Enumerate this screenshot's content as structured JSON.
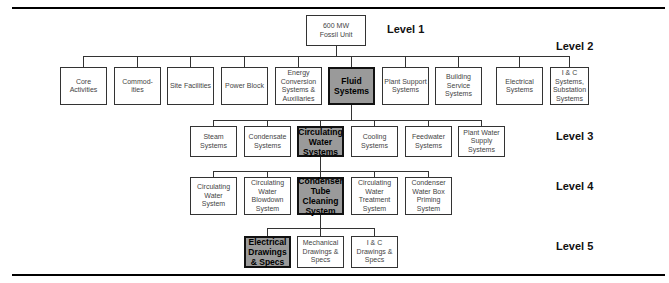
{
  "level_labels": [
    "Level 1",
    "Level 2",
    "Level 3",
    "Level 4",
    "Level 5"
  ],
  "level1": {
    "label": "600 MW\nFossil Unit"
  },
  "level2": [
    {
      "label": "Core Activities"
    },
    {
      "label": "Commod-ities"
    },
    {
      "label": "Site Facilities"
    },
    {
      "label": "Power Block"
    },
    {
      "label": "Energy Conversion Systems & Auxiliaries"
    },
    {
      "label": "Fluid Systems",
      "highlighted": true
    },
    {
      "label": "Plant Support Systems"
    },
    {
      "label": "Building Service Systems"
    },
    {
      "label": "Electrical Systems"
    },
    {
      "label": "I & C Systems, Substation Systems"
    }
  ],
  "level3": [
    {
      "label": "Steam Systems"
    },
    {
      "label": "Condensate Systems"
    },
    {
      "label": "Circulating Water Systems",
      "highlighted": true
    },
    {
      "label": "Cooling Systems"
    },
    {
      "label": "Feedwater Systems"
    },
    {
      "label": "Plant Water Supply Systems"
    }
  ],
  "level4": [
    {
      "label": "Circulating Water System"
    },
    {
      "label": "Circulating Water Blowdown System"
    },
    {
      "label": "Condenser Tube Cleaning System",
      "highlighted": true
    },
    {
      "label": "Circulating Water Treatment System"
    },
    {
      "label": "Condenser Water Box Priming System"
    }
  ],
  "level5": [
    {
      "label": "Electrical Drawings & Specs",
      "highlighted": true
    },
    {
      "label": "Mechanical Drawings & Specs"
    },
    {
      "label": "I & C Drawings & Specs"
    }
  ],
  "colors": {
    "highlight_fill": "#9a9a9a",
    "line": "#333333"
  }
}
